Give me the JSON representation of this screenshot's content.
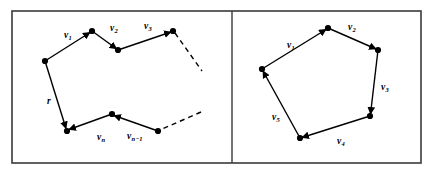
{
  "figure": {
    "background_color": "#ffffff",
    "stroke_color": "#000000",
    "frame": {
      "outer": {
        "x": 12,
        "y": 11,
        "width": 409,
        "height": 152,
        "stroke_width": 1.6
      },
      "divider_x": 232
    }
  },
  "panels": [
    {
      "name": "open-polygonal-chain",
      "description": "open vector chain with dashed continuations",
      "vertices": [
        {
          "name": "p0",
          "x": 45,
          "y": 61
        },
        {
          "name": "p1",
          "x": 92,
          "y": 31
        },
        {
          "name": "p2",
          "x": 118,
          "y": 50
        },
        {
          "name": "p3",
          "x": 173,
          "y": 31
        },
        {
          "name": "p4",
          "x": 158,
          "y": 131
        },
        {
          "name": "p5",
          "x": 112,
          "y": 114
        },
        {
          "name": "p6",
          "x": 67,
          "y": 131
        }
      ],
      "segments": [
        {
          "name": "segment-v1",
          "from": "p0",
          "to": "p1",
          "style": "solid",
          "arrow": "end"
        },
        {
          "name": "segment-v2",
          "from": "p1",
          "to": "p2",
          "style": "solid",
          "arrow": "end"
        },
        {
          "name": "segment-v3",
          "from": "p2",
          "to": "p3",
          "style": "solid",
          "arrow": "end"
        },
        {
          "name": "segment-dashed-top",
          "from": "p3",
          "to": "tip-top",
          "style": "dashed",
          "arrow": "none"
        },
        {
          "name": "segment-dashed-bottom",
          "from": "tip-bottom",
          "to": "p4",
          "style": "dashed",
          "arrow": "none"
        },
        {
          "name": "segment-vn-1",
          "from": "p4",
          "to": "p5",
          "style": "solid",
          "arrow": "end"
        },
        {
          "name": "segment-vn",
          "from": "p5",
          "to": "p6",
          "style": "solid",
          "arrow": "end"
        },
        {
          "name": "segment-r",
          "from": "p0",
          "to": "p6",
          "style": "solid",
          "arrow": "end"
        }
      ],
      "dash_tips": [
        {
          "name": "tip-top",
          "x": 202,
          "y": 71
        },
        {
          "name": "tip-bottom",
          "x": 201,
          "y": 112
        }
      ],
      "labels": [
        {
          "name": "label-v1",
          "base": "v",
          "sub": "1",
          "x": 64,
          "y": 38
        },
        {
          "name": "label-v2",
          "base": "v",
          "sub": "2",
          "x": 110,
          "y": 31
        },
        {
          "name": "label-v3",
          "base": "v",
          "sub": "3",
          "x": 144,
          "y": 29
        },
        {
          "name": "label-r",
          "base": "r",
          "sub": "",
          "x": 47,
          "y": 104
        },
        {
          "name": "label-vn",
          "base": "v",
          "sub": "n",
          "x": 97,
          "y": 140
        },
        {
          "name": "label-vn-1",
          "base": "v",
          "sub": "n−1",
          "x": 127,
          "y": 139
        }
      ]
    },
    {
      "name": "closed-polygon",
      "description": "closed pentagon of five vectors summing to zero",
      "vertices": [
        {
          "name": "q0",
          "x": 262,
          "y": 69
        },
        {
          "name": "q1",
          "x": 328,
          "y": 28
        },
        {
          "name": "q2",
          "x": 378,
          "y": 50
        },
        {
          "name": "q3",
          "x": 370,
          "y": 116
        },
        {
          "name": "q4",
          "x": 300,
          "y": 138
        }
      ],
      "segments": [
        {
          "name": "segment-v1",
          "from": "q0",
          "to": "q1",
          "style": "solid",
          "arrow": "end"
        },
        {
          "name": "segment-v2",
          "from": "q1",
          "to": "q2",
          "style": "solid",
          "arrow": "end"
        },
        {
          "name": "segment-v3",
          "from": "q2",
          "to": "q3",
          "style": "solid",
          "arrow": "end"
        },
        {
          "name": "segment-v4",
          "from": "q3",
          "to": "q4",
          "style": "solid",
          "arrow": "end"
        },
        {
          "name": "segment-v5",
          "from": "q4",
          "to": "q0",
          "style": "solid",
          "arrow": "end"
        }
      ],
      "labels": [
        {
          "name": "label-v1",
          "base": "v",
          "sub": "1",
          "x": 287,
          "y": 48
        },
        {
          "name": "label-v2",
          "base": "v",
          "sub": "2",
          "x": 348,
          "y": 30
        },
        {
          "name": "label-v3",
          "base": "v",
          "sub": "3",
          "x": 381,
          "y": 90
        },
        {
          "name": "label-v4",
          "base": "v",
          "sub": "4",
          "x": 337,
          "y": 144
        },
        {
          "name": "label-v5",
          "base": "v",
          "sub": "5",
          "x": 272,
          "y": 120
        }
      ]
    }
  ]
}
